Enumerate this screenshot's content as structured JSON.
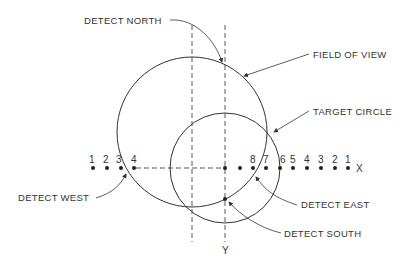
{
  "diagram": {
    "labels": {
      "detect_north": "DETECT NORTH",
      "field_of_view": "FIELD OF VIEW",
      "target_circle": "TARGET CIRCLE",
      "detect_west": "DETECT WEST",
      "detect_east": "DETECT EAST",
      "detect_south": "DETECT SOUTH"
    },
    "axes": {
      "x_label": "X",
      "y_label": "Y"
    },
    "left_points": [
      "1",
      "2",
      "3",
      "4"
    ],
    "right_points": [
      "8",
      "7",
      "6",
      "5",
      "4",
      "3",
      "2",
      "1"
    ]
  }
}
